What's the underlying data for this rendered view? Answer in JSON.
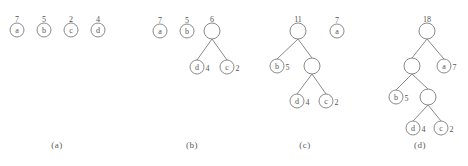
{
  "figure": {
    "background_color": "#ffffff",
    "line_color": "#8a8a8a",
    "text_color": "#555555"
  },
  "panels": [
    {
      "id": "a",
      "caption": "(a)",
      "caption_x": 57,
      "caption_y": 148,
      "nodes": [
        {
          "name": "node-a",
          "label": "a",
          "weight": "7",
          "x": 17,
          "y": 30,
          "r": 7,
          "weight_pos": "above"
        },
        {
          "name": "node-b",
          "label": "b",
          "weight": "5",
          "x": 44,
          "y": 30,
          "r": 7,
          "weight_pos": "above"
        },
        {
          "name": "node-c",
          "label": "c",
          "weight": "2",
          "x": 71,
          "y": 30,
          "r": 7,
          "weight_pos": "above"
        },
        {
          "name": "node-d",
          "label": "d",
          "weight": "4",
          "x": 98,
          "y": 30,
          "r": 7,
          "weight_pos": "above"
        }
      ],
      "edges": []
    },
    {
      "id": "b",
      "caption": "(b)",
      "caption_x": 192,
      "caption_y": 148,
      "nodes": [
        {
          "name": "node-a",
          "label": "a",
          "weight": "7",
          "x": 160,
          "y": 31,
          "r": 7,
          "weight_pos": "above"
        },
        {
          "name": "node-b",
          "label": "b",
          "weight": "5",
          "x": 187,
          "y": 31,
          "r": 7,
          "weight_pos": "above"
        },
        {
          "name": "node-internal-6",
          "label": "",
          "weight": "6",
          "x": 212,
          "y": 31,
          "r": 8,
          "weight_pos": "above"
        },
        {
          "name": "node-d",
          "label": "d",
          "weight": "4",
          "x": 197,
          "y": 67,
          "r": 7,
          "weight_pos": "right"
        },
        {
          "name": "node-c",
          "label": "c",
          "weight": "2",
          "x": 227,
          "y": 67,
          "r": 7,
          "weight_pos": "right"
        }
      ],
      "edges": [
        {
          "name": "edge-6-d",
          "x1": 212,
          "y1": 39,
          "x2": 197,
          "y2": 60
        },
        {
          "name": "edge-6-c",
          "x1": 212,
          "y1": 39,
          "x2": 227,
          "y2": 60
        }
      ]
    },
    {
      "id": "c",
      "caption": "(c)",
      "caption_x": 305,
      "caption_y": 148,
      "nodes": [
        {
          "name": "node-internal-11",
          "label": "",
          "weight": "11",
          "x": 298,
          "y": 31,
          "r": 8,
          "weight_pos": "above"
        },
        {
          "name": "node-a",
          "label": "a",
          "weight": "7",
          "x": 337,
          "y": 31,
          "r": 7,
          "weight_pos": "above"
        },
        {
          "name": "node-b",
          "label": "b",
          "weight": "5",
          "x": 277,
          "y": 66,
          "r": 7,
          "weight_pos": "right"
        },
        {
          "name": "node-internal-6",
          "label": "",
          "weight": "",
          "x": 312,
          "y": 66,
          "r": 8,
          "weight_pos": "above"
        },
        {
          "name": "node-d",
          "label": "d",
          "weight": "4",
          "x": 297,
          "y": 101,
          "r": 7,
          "weight_pos": "right"
        },
        {
          "name": "node-c",
          "label": "c",
          "weight": "2",
          "x": 326,
          "y": 101,
          "r": 7,
          "weight_pos": "right"
        }
      ],
      "edges": [
        {
          "name": "edge-11-b",
          "x1": 298,
          "y1": 39,
          "x2": 277,
          "y2": 59
        },
        {
          "name": "edge-11-6",
          "x1": 298,
          "y1": 39,
          "x2": 312,
          "y2": 58
        },
        {
          "name": "edge-6-d",
          "x1": 312,
          "y1": 74,
          "x2": 297,
          "y2": 94
        },
        {
          "name": "edge-6-c",
          "x1": 312,
          "y1": 74,
          "x2": 326,
          "y2": 94
        }
      ]
    },
    {
      "id": "d",
      "caption": "(d)",
      "caption_x": 420,
      "caption_y": 148,
      "nodes": [
        {
          "name": "node-internal-18",
          "label": "",
          "weight": "18",
          "x": 427,
          "y": 31,
          "r": 8,
          "weight_pos": "above"
        },
        {
          "name": "node-internal-11",
          "label": "",
          "weight": "",
          "x": 412,
          "y": 66,
          "r": 8,
          "weight_pos": "above"
        },
        {
          "name": "node-a",
          "label": "a",
          "weight": "7",
          "x": 444,
          "y": 66,
          "r": 7,
          "weight_pos": "right"
        },
        {
          "name": "node-b",
          "label": "b",
          "weight": "5",
          "x": 396,
          "y": 97,
          "r": 7,
          "weight_pos": "right"
        },
        {
          "name": "node-internal-6",
          "label": "",
          "weight": "",
          "x": 428,
          "y": 97,
          "r": 8,
          "weight_pos": "above"
        },
        {
          "name": "node-d",
          "label": "d",
          "weight": "4",
          "x": 413,
          "y": 128,
          "r": 7,
          "weight_pos": "right"
        },
        {
          "name": "node-c",
          "label": "c",
          "weight": "2",
          "x": 441,
          "y": 128,
          "r": 7,
          "weight_pos": "right"
        }
      ],
      "edges": [
        {
          "name": "edge-18-11",
          "x1": 427,
          "y1": 39,
          "x2": 412,
          "y2": 58
        },
        {
          "name": "edge-18-a",
          "x1": 427,
          "y1": 39,
          "x2": 444,
          "y2": 59
        },
        {
          "name": "edge-11-b",
          "x1": 412,
          "y1": 74,
          "x2": 396,
          "y2": 90
        },
        {
          "name": "edge-11-6",
          "x1": 412,
          "y1": 74,
          "x2": 428,
          "y2": 89
        },
        {
          "name": "edge-6-d",
          "x1": 428,
          "y1": 105,
          "x2": 413,
          "y2": 121
        },
        {
          "name": "edge-6-c",
          "x1": 428,
          "y1": 105,
          "x2": 441,
          "y2": 121
        }
      ]
    }
  ]
}
